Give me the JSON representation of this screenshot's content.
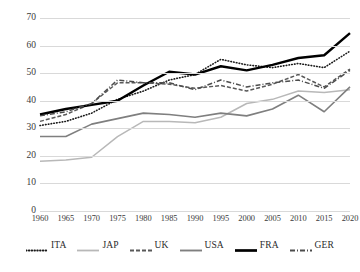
{
  "chart_data": {
    "type": "line",
    "title": "",
    "xlabel": "",
    "ylabel": "",
    "xlim": [
      1960,
      2020
    ],
    "ylim": [
      0,
      70
    ],
    "grid": "horizontal",
    "legend_position": "bottom",
    "categories": [
      1960,
      1965,
      1970,
      1975,
      1980,
      1985,
      1990,
      1995,
      2000,
      2005,
      2010,
      2015,
      2020
    ],
    "x_tick_labels": [
      "1960",
      "1965",
      "1970",
      "1975",
      "1980",
      "1985",
      "1990",
      "1995",
      "2000",
      "2005",
      "2010",
      "2015",
      "2020"
    ],
    "y_tick_labels": [
      "0",
      "10",
      "20",
      "30",
      "40",
      "50",
      "60",
      "70"
    ],
    "y_ticks": [
      0,
      10,
      20,
      30,
      40,
      50,
      60,
      70
    ],
    "series": [
      {
        "name": "ITA",
        "style": "dotted",
        "color": "#1a1a1a",
        "values": [
          31.0,
          32.5,
          35.5,
          40.5,
          43.5,
          47.5,
          49.5,
          55.0,
          53.0,
          52.0,
          53.5,
          52.0,
          58.0
        ]
      },
      {
        "name": "JAP",
        "style": "solid-light",
        "color": "#b8b8b8",
        "values": [
          18.0,
          18.5,
          19.5,
          27.0,
          32.5,
          32.5,
          32.0,
          34.0,
          39.0,
          40.5,
          43.5,
          43.0,
          44.0
        ]
      },
      {
        "name": "UK",
        "style": "dashed",
        "color": "#595959",
        "values": [
          32.5,
          35.0,
          39.0,
          46.5,
          46.5,
          46.0,
          44.5,
          45.5,
          43.5,
          46.0,
          49.5,
          45.0,
          51.5
        ]
      },
      {
        "name": "USA",
        "style": "solid-medium",
        "color": "#7f7f7f",
        "values": [
          27.0,
          27.0,
          31.5,
          33.5,
          35.5,
          35.0,
          34.0,
          35.5,
          34.5,
          37.0,
          42.0,
          36.0,
          45.0
        ]
      },
      {
        "name": "FRA",
        "style": "solid-bold",
        "color": "#000000",
        "values": [
          35.0,
          37.0,
          38.5,
          40.0,
          45.5,
          50.5,
          49.5,
          52.5,
          51.0,
          53.0,
          55.5,
          56.5,
          64.5
        ]
      },
      {
        "name": "GER",
        "style": "dash-dot",
        "color": "#4d4d4d",
        "values": [
          34.5,
          36.0,
          39.0,
          47.5,
          46.5,
          46.5,
          44.0,
          47.5,
          45.0,
          46.5,
          47.5,
          44.5,
          51.0
        ]
      }
    ]
  },
  "legend": {
    "items": [
      {
        "label": "ITA"
      },
      {
        "label": "JAP"
      },
      {
        "label": "UK"
      },
      {
        "label": "USA"
      },
      {
        "label": "FRA"
      },
      {
        "label": "GER"
      }
    ]
  }
}
